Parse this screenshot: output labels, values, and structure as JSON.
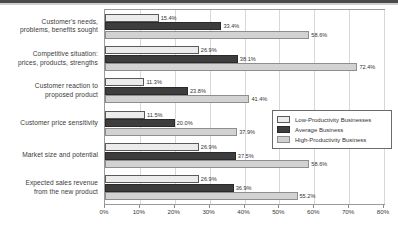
{
  "chart_data": {
    "type": "bar",
    "orientation": "horizontal",
    "title": "",
    "xlabel": "",
    "ylabel": "",
    "xlim": [
      0,
      80
    ],
    "grid": true,
    "legend_position": "right-middle",
    "xticks": [
      "0%",
      "10%",
      "20%",
      "30%",
      "40%",
      "50%",
      "60%",
      "70%",
      "80%"
    ],
    "xtick_values": [
      0,
      10,
      20,
      30,
      40,
      50,
      60,
      70,
      80
    ],
    "categories": [
      "Customer's needs,\nproblems, benefits sought",
      "Competitive situation:\nprices, products, strengths",
      "Customer reaction to\nproposed product",
      "Customer price sensitivity",
      "Market size and potential",
      "Expected sales revenue\nfrom the new product"
    ],
    "category_lines": [
      [
        "Customer's needs,",
        "problems, benefits sought"
      ],
      [
        "Competitive situation:",
        "prices, products, strengths"
      ],
      [
        "Customer reaction to",
        "proposed product"
      ],
      [
        "Customer price sensitivity"
      ],
      [
        "Market size and potential"
      ],
      [
        "Expected sales revenue",
        "from the new product"
      ]
    ],
    "series": [
      {
        "name": "Low-Productivity Businesses",
        "color": "#ececec",
        "values": [
          15.4,
          26.9,
          11.3,
          11.5,
          26.9,
          26.9
        ],
        "labels": [
          "15.4%",
          "26.9%",
          "11.3%",
          "11.5%",
          "26.9%",
          "26.9%"
        ]
      },
      {
        "name": "Average Business",
        "color": "#3d3d3d",
        "values": [
          33.4,
          38.1,
          23.8,
          20.0,
          37.5,
          36.9
        ],
        "labels": [
          "33.4%",
          "38.1%",
          "23.8%",
          "20.0%",
          "37.5%",
          "36.9%"
        ]
      },
      {
        "name": "High-Productivity Business",
        "color": "#d2d2d2",
        "values": [
          58.6,
          72.4,
          41.4,
          37.9,
          58.6,
          55.2
        ],
        "labels": [
          "58.6%",
          "72.4%",
          "41.4%",
          "37.9%",
          "58.6%",
          "55.2%"
        ]
      }
    ]
  },
  "legend": {
    "items": [
      {
        "label": "Low-Productivity Businesses",
        "key": "low"
      },
      {
        "label": "Average Business",
        "key": "avg"
      },
      {
        "label": "High-Productivity Business",
        "key": "high"
      }
    ]
  }
}
